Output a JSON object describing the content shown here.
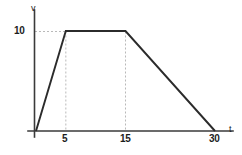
{
  "figure": {
    "background_color": "#ffffff",
    "line_color": "#2b2b2b",
    "axis_color": "#3a3a3a",
    "grid_color": "#b9b9b9"
  },
  "axes": {
    "y_name": "v",
    "x_name": "t"
  },
  "labels": {
    "y_tick_10": "10",
    "x_tick_5": "5",
    "x_tick_15": "15",
    "x_tick_30": "30"
  },
  "chart_data": {
    "type": "line",
    "title": "",
    "subtitle": "",
    "xlabel": "t",
    "ylabel": "v",
    "x": [
      0,
      5,
      15,
      30
    ],
    "values": [
      0,
      10,
      10,
      0
    ],
    "series": [
      {
        "name": "velocity",
        "x": [
          0,
          5,
          15,
          30
        ],
        "values": [
          0,
          10,
          10,
          0
        ]
      }
    ],
    "xlim": [
      0,
      33
    ],
    "ylim": [
      0,
      12.5
    ],
    "xticks": [
      5,
      15,
      30
    ],
    "xticklabels": [
      "5",
      "15",
      "30"
    ],
    "yticks": [
      10
    ],
    "yticklabels": [
      "10"
    ],
    "grid": "dashed-guides-only",
    "guides": {
      "horizontal": [
        10
      ],
      "vertical": [
        5,
        15
      ]
    },
    "legend": null,
    "legend_position": "none",
    "annotations": []
  }
}
